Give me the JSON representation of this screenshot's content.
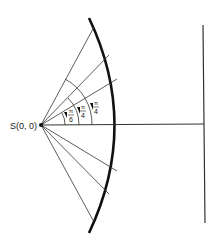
{
  "source_label": "S(0, 0)",
  "angle_labels": [
    {
      "num": "π",
      "den": "6"
    },
    {
      "num": "π",
      "den": "4"
    },
    {
      "num": "π",
      "den": "4"
    }
  ],
  "colors": {
    "stroke": "#222222",
    "background": "#ffffff"
  }
}
